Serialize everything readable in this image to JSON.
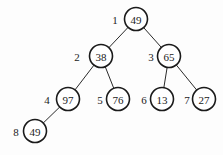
{
  "diagram": {
    "type": "binary-heap-tree",
    "nodes": [
      {
        "index": "1",
        "value": "49",
        "cx": 136,
        "cy": 19,
        "lx": 115
      },
      {
        "index": "2",
        "value": "38",
        "cx": 101,
        "cy": 56,
        "lx": 77
      },
      {
        "index": "3",
        "value": "65",
        "cx": 169,
        "cy": 56,
        "lx": 151
      },
      {
        "index": "4",
        "value": "97",
        "cx": 68,
        "cy": 99,
        "lx": 47
      },
      {
        "index": "5",
        "value": "76",
        "cx": 118,
        "cy": 99,
        "lx": 100
      },
      {
        "index": "6",
        "value": "13",
        "cx": 162,
        "cy": 99,
        "lx": 144
      },
      {
        "index": "7",
        "value": "27",
        "cx": 204,
        "cy": 99,
        "lx": 187
      },
      {
        "index": "8",
        "value": "49",
        "cx": 35,
        "cy": 131,
        "lx": 16
      }
    ],
    "edges": [
      [
        0,
        1
      ],
      [
        0,
        2
      ],
      [
        1,
        3
      ],
      [
        1,
        4
      ],
      [
        2,
        5
      ],
      [
        2,
        6
      ],
      [
        3,
        7
      ]
    ],
    "radius": 11.5,
    "colors": {
      "stroke": "#1a1a1a",
      "background": "#fdfdfd"
    }
  }
}
